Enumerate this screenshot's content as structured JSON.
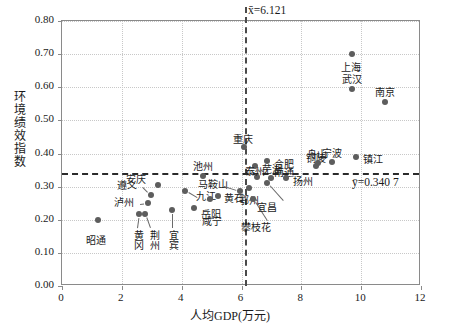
{
  "chart_data": {
    "type": "scatter",
    "title": "",
    "xlabel": "人均GDP(万元)",
    "ylabel": "环境绩效指数",
    "xlim": [
      0,
      12
    ],
    "ylim": [
      0.0,
      0.8
    ],
    "grid": true,
    "legend": "none",
    "xticks": [
      "0",
      "2",
      "4",
      "6",
      "8",
      "10",
      "12"
    ],
    "xtick_values": [
      0,
      2,
      4,
      6,
      8,
      10,
      12
    ],
    "yticks": [
      "0.00",
      "0.10",
      "0.20",
      "0.30",
      "0.40",
      "0.50",
      "0.60",
      "0.70",
      "0.80"
    ],
    "ytick_values": [
      0.0,
      0.1,
      0.2,
      0.3,
      0.4,
      0.5,
      0.6,
      0.7,
      0.8
    ],
    "reference_lines": [
      {
        "name": "x-mean",
        "orientation": "vertical",
        "value": 6.121,
        "label": "x̄=6.121",
        "style": "dashed"
      },
      {
        "name": "y-mean",
        "orientation": "horizontal",
        "value": 0.3407,
        "label": "ȳ=0.340 7",
        "style": "dashed"
      }
    ],
    "points": [
      {
        "label": "昭通",
        "x": 1.2,
        "y": 0.2
      },
      {
        "label": "黄冈",
        "x": 2.58,
        "y": 0.216
      },
      {
        "label": "荆州",
        "x": 2.78,
        "y": 0.216
      },
      {
        "label": "泸州",
        "x": 2.88,
        "y": 0.25
      },
      {
        "label": "遵义",
        "x": 2.98,
        "y": 0.275
      },
      {
        "label": "安庆",
        "x": 3.22,
        "y": 0.305
      },
      {
        "label": "宜宾",
        "x": 3.68,
        "y": 0.228
      },
      {
        "label": "九江",
        "x": 4.12,
        "y": 0.287
      },
      {
        "label": "咸宁",
        "x": 4.42,
        "y": 0.235
      },
      {
        "label": "池州",
        "x": 4.72,
        "y": 0.332
      },
      {
        "label": "岳阳",
        "x": 4.95,
        "y": 0.262
      },
      {
        "label": "黄石",
        "x": 5.22,
        "y": 0.272
      },
      {
        "label": "马鞍山",
        "x": 5.95,
        "y": 0.287
      },
      {
        "label": "重庆",
        "x": 6.1,
        "y": 0.42
      },
      {
        "label": "鄂州",
        "x": 6.25,
        "y": 0.295
      },
      {
        "label": "攀枝花",
        "x": 6.4,
        "y": 0.262
      },
      {
        "label": "芜湖",
        "x": 6.45,
        "y": 0.363
      },
      {
        "label": "泰州",
        "x": 6.52,
        "y": 0.33
      },
      {
        "label": "合肥",
        "x": 6.85,
        "y": 0.378
      },
      {
        "label": "宜昌",
        "x": 6.86,
        "y": 0.31
      },
      {
        "label": "南通",
        "x": 7.0,
        "y": 0.325
      },
      {
        "label": "扬州",
        "x": 7.5,
        "y": 0.325
      },
      {
        "label": "铜陵",
        "x": 8.5,
        "y": 0.362
      },
      {
        "label": "舟山",
        "x": 8.55,
        "y": 0.372
      },
      {
        "label": "宁波",
        "x": 9.02,
        "y": 0.375
      },
      {
        "label": "武汉",
        "x": 9.68,
        "y": 0.595
      },
      {
        "label": "上海",
        "x": 9.7,
        "y": 0.7
      },
      {
        "label": "镇江",
        "x": 9.82,
        "y": 0.39
      },
      {
        "label": "南京",
        "x": 10.78,
        "y": 0.555
      }
    ]
  },
  "labels": {
    "zhaotong": "昭通",
    "huanggang": "黄冈",
    "jingzhou": "荆州",
    "luzhou": "泸州",
    "zunyi": "遵义",
    "anqing": "安庆",
    "yibin": "宜宾",
    "jiujiang": "九江",
    "xianning": "咸宁",
    "chizhou": "池州",
    "yueyang": "岳阳",
    "huangshi": "黄石",
    "maanshan": "马鞍山",
    "chongqing": "重庆",
    "ezhou": "鄂州",
    "panzhihua": "攀枝花",
    "wuhu": "芜湖",
    "taizhou": "泰州",
    "hefei": "合肥",
    "yichang": "宜昌",
    "nantong": "南通",
    "yangzhou": "扬州",
    "tongling": "铜陵",
    "zhoushan": "舟山",
    "ningbo": "宁波",
    "wuhan": "武汉",
    "shanghai": "上海",
    "zhenjiang": "镇江",
    "nanjing": "南京",
    "x_mean": "x̄=6.121",
    "y_mean": "ȳ=0.340 7",
    "axis_x_title": "人均GDP(万元)",
    "axis_y_title": "环境绩效指数"
  },
  "colors": {
    "point": "#5d5d5d",
    "axis": "#8a8a8a",
    "grid": "#c8c8c8",
    "dash": "#2b2b2b",
    "text": "#1a1a1a"
  }
}
